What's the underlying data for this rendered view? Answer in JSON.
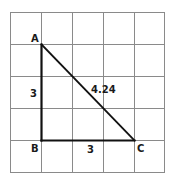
{
  "diagram": {
    "type": "right-triangle-on-grid",
    "grid": {
      "cols": 5,
      "rows": 5,
      "x_lines": [
        10.5,
        41.5,
        72.5,
        103.5,
        134.5,
        164.5
      ],
      "y_lines": [
        12.5,
        44.5,
        76.5,
        108.5,
        140.5,
        172.5
      ],
      "line_color": "#8a8a8a"
    },
    "vertices": {
      "A": {
        "label": "A",
        "x": 41.5,
        "y": 44.5
      },
      "B": {
        "label": "B",
        "x": 41.5,
        "y": 140.5
      },
      "C": {
        "label": "C",
        "x": 134.5,
        "y": 140.5
      }
    },
    "sides": {
      "AB": {
        "length_label": "3"
      },
      "BC": {
        "length_label": "3"
      },
      "AC": {
        "length_label": "4.24"
      }
    },
    "triangle_color": "#111111"
  }
}
